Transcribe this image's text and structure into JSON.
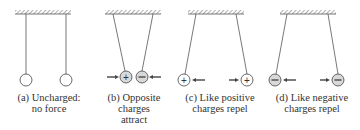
{
  "figure": {
    "colors": {
      "string": "#555555",
      "ball_stroke": "#444444",
      "ball_neutral": "#ffffff",
      "ball_charged": "#d8d8d8",
      "arrow": "#444444",
      "ceiling": "#888888",
      "text": "#333333"
    },
    "panels": [
      {
        "id": "a",
        "label_lines": [
          "(a) Uncharged:",
          "no force"
        ],
        "left_charge": "",
        "right_charge": "",
        "force_description": "none"
      },
      {
        "id": "b",
        "label_lines": [
          "(b) Opposite",
          "charges",
          "attract"
        ],
        "left_charge": "+",
        "right_charge": "−",
        "force_description": "attract"
      },
      {
        "id": "c",
        "label_lines": [
          "(c) Like positive",
          "charges repel"
        ],
        "left_charge": "+",
        "right_charge": "+",
        "force_description": "repel"
      },
      {
        "id": "d",
        "label_lines": [
          "(d) Like negative",
          "charges repel"
        ],
        "left_charge": "−",
        "right_charge": "−",
        "force_description": "repel"
      }
    ]
  }
}
